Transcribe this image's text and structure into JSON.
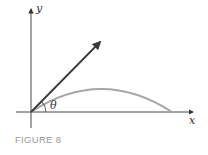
{
  "figure": {
    "caption": "FIGURE 8",
    "caption_color": "#9a9a9a",
    "axes": {
      "x_label": "x",
      "y_label": "y",
      "color": "#333333"
    },
    "angle_label": "θ",
    "vector_color": "#3a3a3a",
    "trajectory_color": "#a6a6a6"
  }
}
